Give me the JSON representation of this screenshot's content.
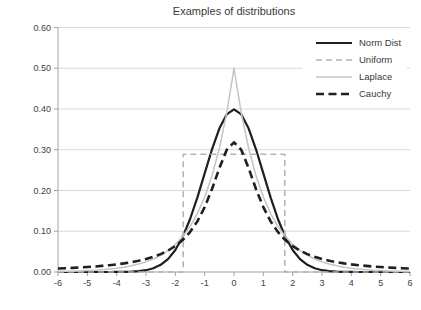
{
  "chart_data": {
    "type": "line",
    "title": "Examples of distributions",
    "xlabel": "",
    "ylabel": "",
    "xlim": [
      -6,
      6
    ],
    "ylim": [
      0,
      0.6
    ],
    "x_tick_labels": [
      "-6",
      "-5",
      "-4",
      "-3",
      "-2",
      "-1",
      "0",
      "1",
      "2",
      "3",
      "4",
      "5",
      "6"
    ],
    "y_tick_labels": [
      "0.00",
      "0.10",
      "0.20",
      "0.30",
      "0.40",
      "0.50",
      "0.60"
    ],
    "grid": "horizontal-gridlines-on",
    "legend_position": "top-right-inside",
    "x": [
      -6,
      -5.75,
      -5.5,
      -5.25,
      -5,
      -4.75,
      -4.5,
      -4.25,
      -4,
      -3.75,
      -3.5,
      -3.25,
      -3,
      -2.75,
      -2.5,
      -2.25,
      -2,
      -1.75,
      -1.5,
      -1.25,
      -1,
      -0.75,
      -0.5,
      -0.25,
      0,
      0.25,
      0.5,
      0.75,
      1,
      1.25,
      1.5,
      1.75,
      2,
      2.25,
      2.5,
      2.75,
      3,
      3.25,
      3.5,
      3.75,
      4,
      4.25,
      4.5,
      4.75,
      5,
      5.25,
      5.5,
      5.75,
      6
    ],
    "series": [
      {
        "name": "Norm Dist",
        "description": "standard normal, peak 0.399 at x=0",
        "color": "#1f1f1f",
        "width": 2.2,
        "dash": null,
        "values": [
          0.0,
          0.0,
          0.0,
          0.0,
          0.0,
          0.0,
          0.0,
          0.0,
          0.0001,
          0.0004,
          0.0009,
          0.002,
          0.0044,
          0.0091,
          0.0175,
          0.0317,
          0.054,
          0.0863,
          0.1295,
          0.1826,
          0.242,
          0.3011,
          0.3521,
          0.3867,
          0.3989,
          0.3867,
          0.3521,
          0.3011,
          0.242,
          0.1826,
          0.1295,
          0.0863,
          0.054,
          0.0317,
          0.0175,
          0.0091,
          0.0044,
          0.002,
          0.0009,
          0.0004,
          0.0001,
          0.0,
          0.0,
          0.0,
          0.0,
          0.0,
          0.0,
          0.0,
          0.0
        ]
      },
      {
        "name": "Uniform",
        "description": "uniform on [-1.732, 1.732], height 0.2887",
        "color": "#b2b2b2",
        "width": 1.5,
        "dash": [
          6,
          4
        ],
        "points": [
          [
            -6,
            0
          ],
          [
            -1.732,
            0
          ],
          [
            -1.732,
            0.2887
          ],
          [
            1.732,
            0.2887
          ],
          [
            1.732,
            0
          ],
          [
            6,
            0
          ]
        ]
      },
      {
        "name": "Laplace",
        "description": "Laplace b=1, peak 0.5 at x=0",
        "color": "#c4c4c4",
        "width": 1.5,
        "dash": null,
        "values": [
          0.0012,
          0.0016,
          0.002,
          0.0026,
          0.0034,
          0.0043,
          0.0056,
          0.0071,
          0.0092,
          0.0118,
          0.0151,
          0.0194,
          0.0249,
          0.032,
          0.041,
          0.0527,
          0.0677,
          0.0869,
          0.1116,
          0.1433,
          0.1839,
          0.2362,
          0.3033,
          0.3894,
          0.5,
          0.3894,
          0.3033,
          0.2362,
          0.1839,
          0.1433,
          0.1116,
          0.0869,
          0.0677,
          0.0527,
          0.041,
          0.032,
          0.0249,
          0.0194,
          0.0151,
          0.0118,
          0.0092,
          0.0071,
          0.0056,
          0.0043,
          0.0034,
          0.0026,
          0.002,
          0.0016,
          0.0012
        ]
      },
      {
        "name": "Cauchy",
        "description": "standard Cauchy, peak 0.318 at x=0",
        "color": "#1f1f1f",
        "width": 2.6,
        "dash": [
          8,
          4.5
        ],
        "values": [
          0.0086,
          0.0093,
          0.0102,
          0.0111,
          0.0122,
          0.0135,
          0.015,
          0.0167,
          0.0187,
          0.0211,
          0.024,
          0.0275,
          0.0318,
          0.0372,
          0.0439,
          0.0525,
          0.0637,
          0.0783,
          0.0979,
          0.1242,
          0.1592,
          0.2037,
          0.2546,
          0.2996,
          0.3183,
          0.2996,
          0.2546,
          0.2037,
          0.1592,
          0.1242,
          0.0979,
          0.0783,
          0.0637,
          0.0525,
          0.0439,
          0.0372,
          0.0318,
          0.0275,
          0.024,
          0.0211,
          0.0187,
          0.0167,
          0.015,
          0.0135,
          0.0122,
          0.0111,
          0.0102,
          0.0093,
          0.0086
        ]
      }
    ],
    "style": {
      "gridline_color": "#d9d9d9",
      "axis_color": "#a3a3a3",
      "tick_label_color": "#404040",
      "background": "#ffffff"
    },
    "layout": {
      "plot_left": 58,
      "plot_right": 410,
      "plot_top": 27.5,
      "plot_bottom": 272
    }
  }
}
